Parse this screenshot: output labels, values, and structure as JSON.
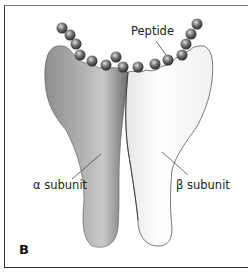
{
  "figure": {
    "panel_label": "B",
    "labels": {
      "peptide": "Peptide",
      "alpha": "α subunit",
      "beta": "β subunit"
    },
    "colors": {
      "alpha_fill": "#8a8a8a",
      "alpha_highlight": "#c4c4c4",
      "beta_fill": "#f4f4f4",
      "bead": "#555555",
      "frame": "#333333"
    },
    "bead_count": 15
  }
}
